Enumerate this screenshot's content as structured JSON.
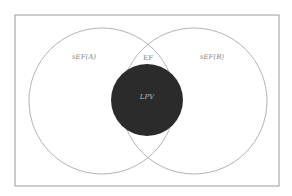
{
  "diagram": {
    "type": "venn",
    "colors": {
      "background": "#ffffff",
      "frame_stroke": "#9a9a9a",
      "circle_stroke": "#a0a0a0",
      "center_fill": "#2b2b2b",
      "label_color": "#888888",
      "center_label_color": "#bdbdbd"
    },
    "frame": {
      "x": 15,
      "y": 15,
      "width": 264,
      "height": 171
    },
    "sets": [
      {
        "id": "A",
        "label": "sEF(A)",
        "cx": 102,
        "cy": 101,
        "r": 73,
        "label_x": 84,
        "label_y": 57
      },
      {
        "id": "B",
        "label": "sEF(B)",
        "cx": 194,
        "cy": 101,
        "r": 73,
        "label_x": 212,
        "label_y": 57
      }
    ],
    "intersection": {
      "label": "EF",
      "label_x": 148,
      "label_y": 58
    },
    "center": {
      "label": "LPV",
      "cx": 147,
      "cy": 100,
      "r": 36,
      "label_x": 147,
      "label_y": 97
    }
  }
}
